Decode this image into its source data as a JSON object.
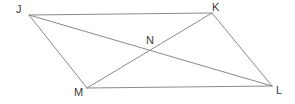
{
  "figure": {
    "background_color": "#ffffff",
    "stroke_color": "#8a8a8a",
    "label_color": "#3a3a3a",
    "stroke_width": 1,
    "canvas": {
      "width": 295,
      "height": 104
    },
    "points": [
      {
        "id": "J",
        "label": "J",
        "x": 29,
        "y": 15,
        "label_x": 16,
        "label_y": 4
      },
      {
        "id": "K",
        "label": "K",
        "x": 212,
        "y": 13,
        "label_x": 212,
        "label_y": 2
      },
      {
        "id": "L",
        "label": "L",
        "x": 272,
        "y": 86,
        "label_x": 276,
        "label_y": 85
      },
      {
        "id": "M",
        "label": "M",
        "x": 87,
        "y": 88,
        "label_x": 74,
        "label_y": 87
      },
      {
        "id": "N",
        "label": "N",
        "x": 152,
        "y": 52,
        "label_x": 146,
        "label_y": 35
      }
    ],
    "segments": [
      {
        "name": "side-JK",
        "from": "J",
        "to": "K"
      },
      {
        "name": "side-KL",
        "from": "K",
        "to": "L"
      },
      {
        "name": "side-ML",
        "from": "M",
        "to": "L"
      },
      {
        "name": "side-JM",
        "from": "J",
        "to": "M"
      },
      {
        "name": "diagonal-JL",
        "from": "J",
        "to": "L"
      },
      {
        "name": "diagonal-MK",
        "from": "M",
        "to": "K"
      }
    ]
  }
}
